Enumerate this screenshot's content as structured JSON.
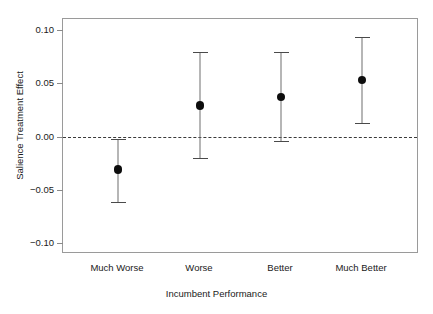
{
  "chart_data": {
    "type": "scatter",
    "title": "",
    "xlabel": "Incumbent Performance",
    "ylabel": "Salience Treatment Effect",
    "categories": [
      "Much Worse",
      "Worse",
      "Better",
      "Much Better"
    ],
    "values": [
      -0.031,
      0.029,
      0.037,
      0.053
    ],
    "ci_lower": [
      -0.061,
      -0.02,
      -0.004,
      0.013
    ],
    "ci_upper": [
      -0.002,
      0.079,
      0.079,
      0.093
    ],
    "ylim": [
      -0.11,
      0.11
    ],
    "yticks": [
      0.1,
      0.05,
      0.0,
      -0.05,
      -0.1
    ],
    "ytick_labels": [
      "0.10",
      "0.05",
      "0.00",
      "-0.05",
      "-0.10"
    ],
    "grid": false,
    "legend": null,
    "reference_line": {
      "y": 0.0,
      "style": "dashed"
    },
    "marker": "filled-circle",
    "errorbar_style": "line-with-caps",
    "point_color": "#0d0d0d",
    "line_color": "#6e6e6e",
    "axis_color": "#9a9a9a"
  },
  "axis": {
    "y_title": "Salience Treatment Effect",
    "x_title": "Incumbent Performance",
    "y_tick_labels": [
      "0.10",
      "0.05",
      "0.00",
      "-0.05",
      "-0.10"
    ],
    "x_tick_labels": [
      "Much Worse",
      "Worse",
      "Better",
      "Much Better"
    ]
  }
}
